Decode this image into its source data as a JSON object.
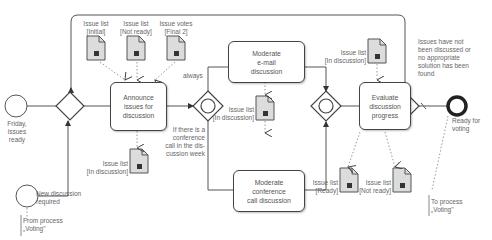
{
  "diagram": {
    "type": "BPMN process",
    "events": {
      "start_friday": "Friday, issues ready",
      "start_new_discussion": "New discussion required",
      "end_ready": "Ready for voting"
    },
    "tasks": {
      "announce": "Announce issues for discussion",
      "email": "Moderate e-mail discussion",
      "conference": "Moderate conference call discussion",
      "evaluate": "Evaluate discussion progress"
    },
    "data_objects": {
      "initial": "Issue list [Initial]",
      "not_ready_top": "Issue list [Not ready]",
      "votes": "Issue votes [Final 2]",
      "announce_out": "Issue list [In discussion]",
      "email_conf": "Issue list [In discussion]",
      "evaluate_in": "Issue list [In discussion]",
      "ready": "Issue list [Ready]",
      "not_ready_bottom": "Issue list [Not ready]"
    },
    "conditions": {
      "always": "always",
      "conference": "If there is a conference call in the dis-cussion week",
      "loop": "Issues have not been discussed or no appropriate solution has been found"
    },
    "annotations": {
      "from": "From process „Voting\"",
      "to": "To process „Voting\""
    }
  },
  "labels": {
    "friday": [
      "Friday,",
      "issues",
      "ready"
    ],
    "new_disc": [
      "New discussion",
      "required"
    ],
    "from_proc": [
      "From process",
      "„Voting\""
    ],
    "to_proc": [
      "To process",
      "„Voting\""
    ],
    "ready_voting": [
      "Ready for",
      "voting"
    ],
    "doc_initial": [
      "Issue list",
      "[Initial]"
    ],
    "doc_notready_top": [
      "Issue list",
      "[Not ready]"
    ],
    "doc_votes": [
      "Issue votes",
      "[Final 2]"
    ],
    "doc_announce": [
      "Issue list",
      "[In discussion]"
    ],
    "doc_mid": [
      "Issue list",
      "[In discussion]"
    ],
    "doc_eval": [
      "Issue list",
      "[In discussion]"
    ],
    "doc_ready": [
      "Issue list",
      "[Ready]"
    ],
    "doc_notready_bottom": [
      "Issue list",
      "[Not ready]"
    ],
    "always": "always",
    "cond_conf": [
      "If there is a",
      "conference",
      "call in the dis-",
      "cussion week"
    ],
    "cond_loop": [
      "Issues have not",
      "been discussed or",
      "no appropriate",
      "solution has been",
      "found"
    ],
    "task_announce": [
      "Announce",
      "issues for",
      "discussion"
    ],
    "task_email": [
      "Moderate",
      "e-mail",
      "discussion"
    ],
    "task_conf": [
      "Moderate",
      "conference",
      "call discussion"
    ],
    "task_eval": [
      "Evaluate",
      "discussion",
      "progress"
    ]
  }
}
